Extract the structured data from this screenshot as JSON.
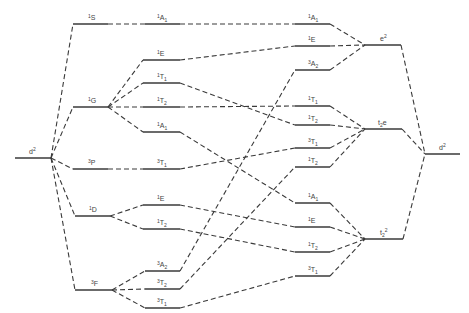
{
  "diagram": {
    "left_config": {
      "label": "d",
      "sup": "2"
    },
    "right_config": {
      "label": "d",
      "sup": "2"
    },
    "free_ion_terms": [
      {
        "id": "S1",
        "mult": "1",
        "sym": "S"
      },
      {
        "id": "G1",
        "mult": "1",
        "sym": "G"
      },
      {
        "id": "P3",
        "mult": "3",
        "sym": "P"
      },
      {
        "id": "D1",
        "mult": "1",
        "sym": "D"
      },
      {
        "id": "F3",
        "mult": "3",
        "sym": "F"
      }
    ],
    "weak_field_states": [
      {
        "mult": "1",
        "sym": "A",
        "sub": "1"
      },
      {
        "mult": "1",
        "sym": "E",
        "sub": ""
      },
      {
        "mult": "1",
        "sym": "T",
        "sub": "1"
      },
      {
        "mult": "1",
        "sym": "T",
        "sub": "2"
      },
      {
        "mult": "1",
        "sym": "A",
        "sub": "1"
      },
      {
        "mult": "3",
        "sym": "T",
        "sub": "1"
      },
      {
        "mult": "1",
        "sym": "E",
        "sub": ""
      },
      {
        "mult": "1",
        "sym": "T",
        "sub": "2"
      },
      {
        "mult": "3",
        "sym": "A",
        "sub": "2"
      },
      {
        "mult": "3",
        "sym": "T",
        "sub": "2"
      },
      {
        "mult": "3",
        "sym": "T",
        "sub": "1"
      }
    ],
    "strong_field_states": [
      {
        "mult": "1",
        "sym": "A",
        "sub": "1"
      },
      {
        "mult": "1",
        "sym": "E",
        "sub": ""
      },
      {
        "mult": "3",
        "sym": "A",
        "sub": "2"
      },
      {
        "mult": "1",
        "sym": "T",
        "sub": "1"
      },
      {
        "mult": "1",
        "sym": "T",
        "sub": "2"
      },
      {
        "mult": "3",
        "sym": "T",
        "sub": "1"
      },
      {
        "mult": "1",
        "sym": "T",
        "sub": "2"
      },
      {
        "mult": "1",
        "sym": "A",
        "sub": "1"
      },
      {
        "mult": "1",
        "sym": "E",
        "sub": ""
      },
      {
        "mult": "1",
        "sym": "T",
        "sub": "2"
      },
      {
        "mult": "3",
        "sym": "T",
        "sub": "1"
      }
    ],
    "strong_field_configs": [
      {
        "label": "e",
        "sup": "2",
        "sub": ""
      },
      {
        "label": "t",
        "sub": "2",
        "tail": "e"
      },
      {
        "label": "t",
        "sub": "2",
        "sup": "2"
      }
    ]
  }
}
